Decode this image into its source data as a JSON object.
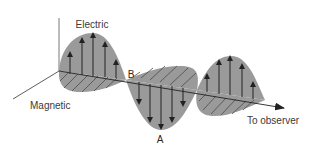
{
  "diagram": {
    "labels": {
      "electric": "Electric",
      "magnetic": "Magnetic",
      "observer": "To observer",
      "point_a": "A",
      "point_b": "B"
    },
    "colors": {
      "fill": "#9a9a9a",
      "line": "#222222",
      "hatch": "#4a4a4a",
      "text": "#3a3a3a"
    }
  }
}
